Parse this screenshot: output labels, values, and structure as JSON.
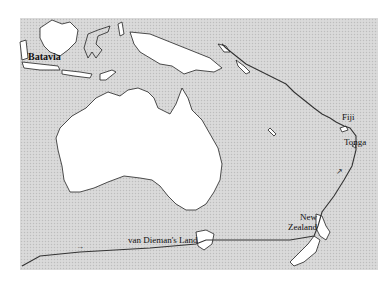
{
  "map": {
    "title": "",
    "labels": {
      "batavia": "Batavia",
      "fiji": "Fiji",
      "tonga": "Tonga",
      "new_zealand_line1": "New",
      "new_zealand_line2": "Zealand",
      "van_diemens_land": "van Dieman's Land"
    },
    "colors": {
      "sea": "#d6d6d6",
      "land": "#ffffff",
      "coastline": "#222222",
      "route": "#333333"
    },
    "route_arrows": [
      "arrow-southwest-pacific",
      "arrow-indian-ocean"
    ]
  }
}
